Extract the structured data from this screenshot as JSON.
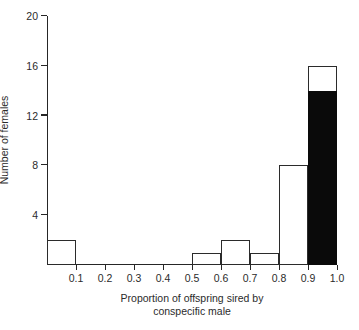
{
  "chart_data": {
    "type": "bar",
    "title": "",
    "subtitle": "",
    "xlabel_line1": "Proportion of offspring sired by",
    "xlabel_line2": "conspecific male",
    "ylabel": "Number of females",
    "xlim": [
      0.0,
      1.0
    ],
    "ylim": [
      0,
      20
    ],
    "grid": false,
    "legend": "none",
    "bin_width": 0.1,
    "x_tick_labels": [
      "0.1",
      "0.2",
      "0.3",
      "0.4",
      "0.5",
      "0.6",
      "0.7",
      "0.8",
      "0.9",
      "1.0"
    ],
    "x_tick_values": [
      0.1,
      0.2,
      0.3,
      0.4,
      0.5,
      0.6,
      0.7,
      0.8,
      0.9,
      1.0
    ],
    "y_tick_labels": [
      "20",
      "16",
      "12",
      "8",
      "4"
    ],
    "y_tick_values": [
      20,
      16,
      12,
      8,
      4
    ],
    "categories": [
      "0.0-0.1",
      "0.1-0.2",
      "0.2-0.3",
      "0.3-0.4",
      "0.4-0.5",
      "0.5-0.6",
      "0.6-0.7",
      "0.7-0.8",
      "0.8-0.9",
      "0.9-1.0"
    ],
    "values": [
      2,
      0,
      0,
      0,
      0,
      1,
      2,
      1,
      8,
      16
    ],
    "series": [
      {
        "name": "open (unfilled)",
        "fill": "#ffffff",
        "values": [
          2,
          0,
          0,
          0,
          0,
          1,
          2,
          1,
          8,
          2
        ]
      },
      {
        "name": "solid (filled black)",
        "fill": "#0a0a0a",
        "values": [
          0,
          0,
          0,
          0,
          0,
          0,
          0,
          0,
          0,
          14
        ]
      }
    ],
    "bars": [
      {
        "bin_start": 0.0,
        "bin_end": 0.1,
        "total": 2,
        "filled": 0
      },
      {
        "bin_start": 0.1,
        "bin_end": 0.2,
        "total": 0,
        "filled": 0
      },
      {
        "bin_start": 0.2,
        "bin_end": 0.3,
        "total": 0,
        "filled": 0
      },
      {
        "bin_start": 0.3,
        "bin_end": 0.4,
        "total": 0,
        "filled": 0
      },
      {
        "bin_start": 0.4,
        "bin_end": 0.5,
        "total": 0,
        "filled": 0
      },
      {
        "bin_start": 0.5,
        "bin_end": 0.6,
        "total": 1,
        "filled": 0
      },
      {
        "bin_start": 0.6,
        "bin_end": 0.7,
        "total": 2,
        "filled": 0
      },
      {
        "bin_start": 0.7,
        "bin_end": 0.8,
        "total": 1,
        "filled": 0
      },
      {
        "bin_start": 0.8,
        "bin_end": 0.9,
        "total": 8,
        "filled": 0
      },
      {
        "bin_start": 0.9,
        "bin_end": 1.0,
        "total": 16,
        "filled": 14
      }
    ],
    "colors": {
      "axis": "#262626",
      "bar_outline": "#2b2b2b",
      "bar_open_fill": "#ffffff",
      "bar_solid_fill": "#0a0a0a",
      "background": "#ffffff"
    }
  }
}
